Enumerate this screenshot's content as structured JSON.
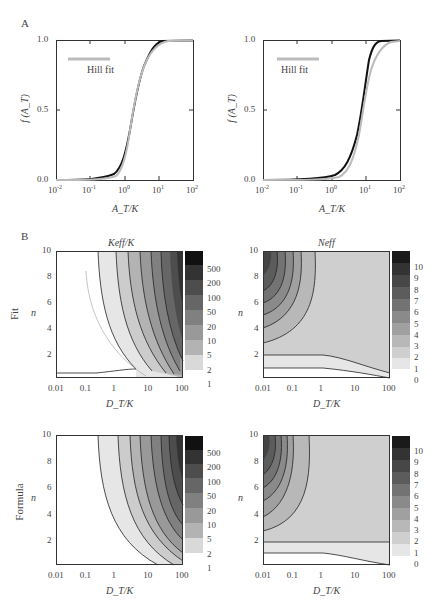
{
  "panel_labels": {
    "a": "A",
    "b": "B"
  },
  "row_labels": {
    "fit": "Fit",
    "formula": "Formula"
  },
  "panel_a": {
    "legend_label": "Hill fit",
    "ylabel": "f (A_T)",
    "xlabel": "A_T/K",
    "yticks": [
      "0.0",
      "0.5",
      "1.0"
    ],
    "xticks": [
      "10-2",
      "10-1",
      "100",
      "101",
      "102"
    ]
  },
  "panel_b": {
    "titles": {
      "keff": "Keff/K",
      "neff": "Neff"
    },
    "xlabel": "D_T/K",
    "ylabel": "n",
    "xticks": [
      "0.01",
      "0.1",
      "1",
      "10",
      "100"
    ],
    "yticks": [
      "2",
      "4",
      "6",
      "8",
      "10"
    ],
    "keff_colorbar": [
      "500",
      "200",
      "100",
      "50",
      "20",
      "10",
      "5",
      "2",
      "1"
    ],
    "neff_colorbar": [
      "10",
      "9",
      "8",
      "7",
      "6",
      "5",
      "4",
      "3",
      "2",
      "1",
      "0"
    ]
  },
  "chart_data": [
    {
      "type": "line",
      "panel": "A-left",
      "xscale": "log",
      "xlim": [
        0.01,
        100
      ],
      "ylim": [
        0,
        1
      ],
      "xlabel": "A_T/K",
      "ylabel": "f(A_T)",
      "series": [
        {
          "name": "model",
          "color": "#111111",
          "x": [
            0.01,
            0.1,
            0.3,
            1,
            2,
            3,
            5,
            10,
            100
          ],
          "y": [
            0.0,
            0.01,
            0.06,
            0.3,
            0.55,
            0.72,
            0.88,
            0.99,
            1.0
          ]
        },
        {
          "name": "Hill fit",
          "color": "#bbbbbb",
          "x": [
            0.01,
            0.1,
            0.3,
            1,
            2,
            3,
            5,
            10,
            100
          ],
          "y": [
            0.0,
            0.005,
            0.04,
            0.27,
            0.55,
            0.73,
            0.88,
            0.97,
            1.0
          ]
        }
      ]
    },
    {
      "type": "line",
      "panel": "A-right",
      "xscale": "log",
      "xlim": [
        0.01,
        100
      ],
      "ylim": [
        0,
        1
      ],
      "xlabel": "A_T/K",
      "ylabel": "f(A_T)",
      "series": [
        {
          "name": "model",
          "color": "#111111",
          "x": [
            0.01,
            0.1,
            1,
            2,
            5,
            8,
            10,
            15,
            30,
            100
          ],
          "y": [
            0.0,
            0.0,
            0.03,
            0.1,
            0.35,
            0.6,
            0.78,
            0.95,
            1.0,
            1.0
          ]
        },
        {
          "name": "Hill fit",
          "color": "#bbbbbb",
          "x": [
            0.01,
            0.1,
            1,
            2,
            5,
            8,
            10,
            15,
            30,
            100
          ],
          "y": [
            0.0,
            0.0,
            0.01,
            0.06,
            0.3,
            0.58,
            0.72,
            0.88,
            0.98,
            1.0
          ]
        }
      ]
    },
    {
      "type": "heatmap",
      "panel": "B-Fit-Keff",
      "title": "Keff/K",
      "xscale": "log",
      "xlim": [
        0.01,
        100
      ],
      "ylim": [
        0.2,
        10
      ],
      "xlabel": "D_T/K",
      "ylabel": "n",
      "levels": [
        1,
        2,
        5,
        10,
        20,
        50,
        100,
        200,
        500
      ]
    },
    {
      "type": "heatmap",
      "panel": "B-Fit-Neff",
      "title": "Neff",
      "xscale": "log",
      "xlim": [
        0.01,
        100
      ],
      "ylim": [
        0.2,
        10
      ],
      "xlabel": "D_T/K",
      "ylabel": "n",
      "levels": [
        0,
        1,
        2,
        3,
        4,
        5,
        6,
        7,
        8,
        9,
        10
      ]
    },
    {
      "type": "heatmap",
      "panel": "B-Formula-Keff",
      "xscale": "log",
      "xlim": [
        0.01,
        100
      ],
      "ylim": [
        0.2,
        10
      ],
      "xlabel": "D_T/K",
      "ylabel": "n",
      "levels": [
        1,
        2,
        5,
        10,
        20,
        50,
        100,
        200,
        500
      ]
    },
    {
      "type": "heatmap",
      "panel": "B-Formula-Neff",
      "xscale": "log",
      "xlim": [
        0.01,
        100
      ],
      "ylim": [
        0.2,
        10
      ],
      "xlabel": "D_T/K",
      "ylabel": "n",
      "levels": [
        0,
        1,
        2,
        3,
        4,
        5,
        6,
        7,
        8,
        9,
        10
      ]
    }
  ]
}
